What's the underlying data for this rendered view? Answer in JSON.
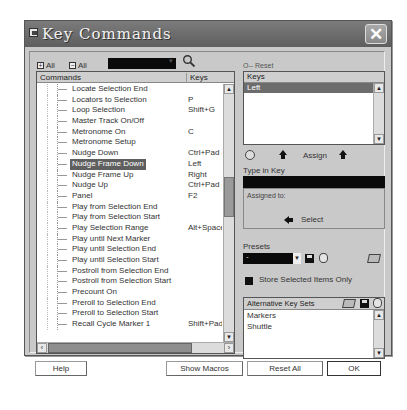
{
  "window": {
    "title": "Key Commands"
  },
  "toolbar": {
    "expand_all_label": "All",
    "collapse_all_label": "All",
    "search_value": "",
    "reset_label": "O-- Reset"
  },
  "commands": {
    "header_commands": "Commands",
    "header_keys": "Keys",
    "rows": [
      {
        "name": "Locate Selection End",
        "keys": ""
      },
      {
        "name": "Locators to Selection",
        "keys": "P"
      },
      {
        "name": "Loop Selection",
        "keys": "Shift+G"
      },
      {
        "name": "Master Track On/Off",
        "keys": ""
      },
      {
        "name": "Metronome On",
        "keys": "C"
      },
      {
        "name": "Metronome Setup",
        "keys": ""
      },
      {
        "name": "Nudge Down",
        "keys": "Ctrl+Pad -"
      },
      {
        "name": "Nudge Frame Down",
        "keys": "Left",
        "selected": true
      },
      {
        "name": "Nudge Frame Up",
        "keys": "Right"
      },
      {
        "name": "Nudge Up",
        "keys": "Ctrl+Pad +"
      },
      {
        "name": "Panel",
        "keys": "F2"
      },
      {
        "name": "Play from Selection End",
        "keys": ""
      },
      {
        "name": "Play from Selection Start",
        "keys": ""
      },
      {
        "name": "Play Selection Range",
        "keys": "Alt+Space"
      },
      {
        "name": "Play until Next Marker",
        "keys": ""
      },
      {
        "name": "Play until Selection End",
        "keys": ""
      },
      {
        "name": "Play until Selection Start",
        "keys": ""
      },
      {
        "name": "Postroll from Selection End",
        "keys": ""
      },
      {
        "name": "Postroll from Selection Start",
        "keys": ""
      },
      {
        "name": "Precount On",
        "keys": ""
      },
      {
        "name": "Preroll to Selection End",
        "keys": ""
      },
      {
        "name": "Preroll to Selection Start",
        "keys": ""
      },
      {
        "name": "Recall Cycle Marker 1",
        "keys": "Shift+Pad1"
      }
    ]
  },
  "keys_panel": {
    "header": "Keys",
    "items": [
      "Left"
    ]
  },
  "assign": {
    "label": "Assign"
  },
  "type_in_key": {
    "label": "Type in Key",
    "value": ""
  },
  "assigned_to": {
    "label": "Assigned to:",
    "select_label": "Select"
  },
  "presets": {
    "label": "Presets",
    "value": "-"
  },
  "store_selected": {
    "label": "Store Selected Items Only",
    "checked": true
  },
  "alt_key_sets": {
    "header": "Alternative Key Sets",
    "items": [
      "Markers",
      "Shuttle"
    ]
  },
  "buttons": {
    "help": "Help",
    "show_macros": "Show Macros",
    "reset_all": "Reset All",
    "ok": "OK"
  }
}
